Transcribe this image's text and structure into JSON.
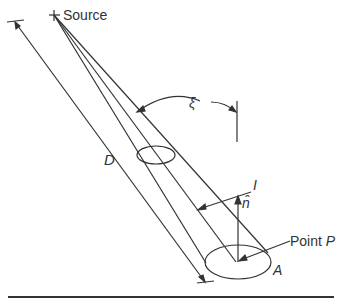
{
  "diagram": {
    "labels": {
      "source": "Source",
      "distance": "D",
      "angle": "ξ",
      "intensity": "I",
      "normal": "n̂",
      "point_prefix": "Point ",
      "point_var": "P",
      "area": "A"
    },
    "colors": {
      "stroke": "#333333",
      "background": "#ffffff"
    }
  }
}
